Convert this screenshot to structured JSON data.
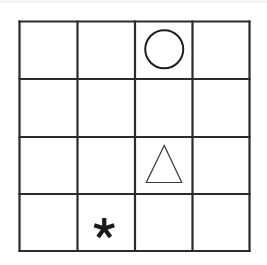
{
  "diagram": {
    "type": "grid-puzzle",
    "rows": 4,
    "cols": 4,
    "line_color": "#2b2b2b",
    "background": "#ffffff",
    "grid_box": {
      "x": 19.5,
      "y": 21.5,
      "width": 230,
      "height": 229.5
    },
    "col_lines": [
      19.5,
      77.5,
      135,
      192.5,
      249.5
    ],
    "row_lines": [
      21.5,
      79,
      137,
      194,
      251
    ],
    "symbols": [
      {
        "shape": "circle",
        "row": 0,
        "col": 2,
        "label": "circle"
      },
      {
        "shape": "triangle",
        "row": 2,
        "col": 2,
        "label": "triangle"
      },
      {
        "shape": "asterisk",
        "row": 3,
        "col": 1,
        "label": "asterisk"
      }
    ]
  }
}
